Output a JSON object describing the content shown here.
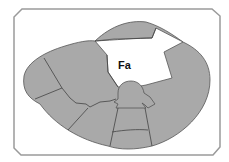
{
  "diagram": {
    "type": "cross-section",
    "labels": {
      "center_label": "Fa"
    },
    "colors": {
      "background": "#ffffff",
      "frame": "#9a9a9a",
      "region_fill": "#a9a9a9",
      "region_outline": "#555555",
      "highlight_fill": "#ffffff",
      "label_text": "#111111"
    },
    "regions": [
      {
        "id": "top-cap",
        "fill": "gray"
      },
      {
        "id": "highlighted-Fa",
        "fill": "white",
        "label": "Fa"
      },
      {
        "id": "upper-left",
        "fill": "gray"
      },
      {
        "id": "far-left",
        "fill": "gray"
      },
      {
        "id": "lower-left",
        "fill": "gray"
      },
      {
        "id": "bottom-left",
        "fill": "gray"
      },
      {
        "id": "central-knob",
        "fill": "gray"
      },
      {
        "id": "central-column-upper",
        "fill": "gray"
      },
      {
        "id": "central-column-lower",
        "fill": "gray"
      },
      {
        "id": "right-large",
        "fill": "gray"
      }
    ]
  }
}
